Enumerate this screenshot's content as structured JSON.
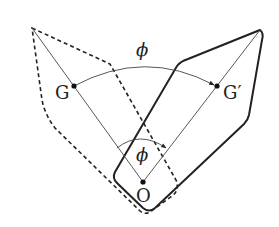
{
  "diagram": {
    "labels": {
      "G": "G",
      "G_prime": "G′",
      "O": "O",
      "phi_top": "ϕ",
      "phi_center": "ϕ"
    },
    "colors": {
      "stroke": "#222222",
      "background": "#ffffff"
    },
    "points": {
      "G": [
        74,
        86
      ],
      "G_prime": [
        217,
        86
      ],
      "O": [
        143,
        182
      ],
      "apex_original": [
        32,
        28
      ],
      "apex_rotated": [
        260,
        30
      ]
    }
  }
}
